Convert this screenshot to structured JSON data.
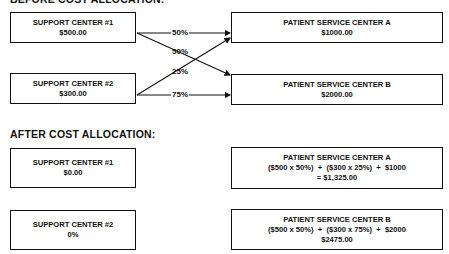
{
  "before": {
    "heading": "BEFORE COST ALLOCATION:",
    "support_centers": [
      {
        "name": "SUPPORT CENTER #1",
        "value": "$500.00"
      },
      {
        "name": "SUPPORT CENTER #2",
        "value": "$300.00"
      }
    ],
    "patient_centers": [
      {
        "name": "PATIENT SERVICE CENTER A",
        "value": "$1000.00"
      },
      {
        "name": "PATIENT SERVICE CENTER B",
        "value": "$2000.00"
      }
    ],
    "allocations": [
      {
        "from": "SUPPORT CENTER #1",
        "to": "PATIENT SERVICE CENTER A",
        "label": "50%"
      },
      {
        "from": "SUPPORT CENTER #1",
        "to": "PATIENT SERVICE CENTER B",
        "label": "50%"
      },
      {
        "from": "SUPPORT CENTER #2",
        "to": "PATIENT SERVICE CENTER A",
        "label": "25%"
      },
      {
        "from": "SUPPORT CENTER #2",
        "to": "PATIENT SERVICE CENTER B",
        "label": "75%"
      }
    ]
  },
  "after": {
    "heading": "AFTER COST ALLOCATION:",
    "support_centers": [
      {
        "name": "SUPPORT CENTER #1",
        "value": "$0.00"
      },
      {
        "name": "SUPPORT CENTER #2",
        "value": "0%"
      }
    ],
    "patient_centers": [
      {
        "name": "PATIENT SERVICE CENTER A",
        "formula": "($500 x 50%)  +  ($300 x 25%)  +  $1000",
        "value": "= $1,325.00"
      },
      {
        "name": "PATIENT SERVICE CENTER B",
        "formula": "($500 x 50%)  +  ($300 x 75%)  +  $2000",
        "value": "$2475.00"
      }
    ]
  }
}
